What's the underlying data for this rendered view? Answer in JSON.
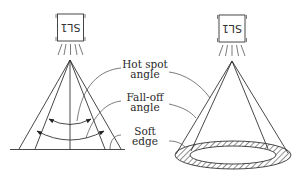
{
  "diagram": {
    "left_light": {
      "label": "SL1",
      "orientation": "upside-down"
    },
    "right_light": {
      "label": "SL1",
      "orientation": "upside-down"
    },
    "labels": {
      "hot_spot": {
        "line1": "Hot spot",
        "line2": "angle"
      },
      "fall_off": {
        "line1": "Fall-off",
        "line2": "angle"
      },
      "soft_edge": {
        "line1": "Soft",
        "line2": "edge"
      }
    },
    "colors": {
      "stroke": "#333333",
      "background": "#ffffff",
      "hatch": "#333333"
    }
  }
}
